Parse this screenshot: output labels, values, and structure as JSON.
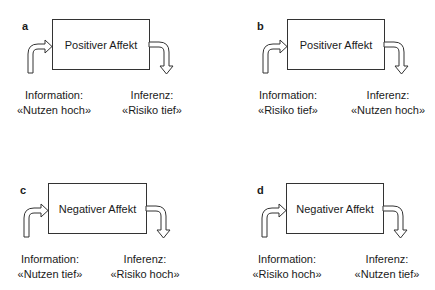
{
  "panels": [
    {
      "letter": "a",
      "affect": "Positiver Affekt",
      "info_label": "Information:",
      "info_value": "«Nutzen hoch»",
      "inf_label": "Inferenz:",
      "inf_value": "«Risiko tief»"
    },
    {
      "letter": "b",
      "affect": "Positiver Affekt",
      "info_label": "Information:",
      "info_value": "«Risiko tief»",
      "inf_label": "Inferenz:",
      "inf_value": "«Nutzen hoch»"
    },
    {
      "letter": "c",
      "affect": "Negativer Affekt",
      "info_label": "Information:",
      "info_value": "«Nutzen tief»",
      "inf_label": "Inferenz:",
      "inf_value": "«Risiko hoch»"
    },
    {
      "letter": "d",
      "affect": "Negativer Affekt",
      "info_label": "Information:",
      "info_value": "«Risiko hoch»",
      "inf_label": "Inferenz:",
      "inf_value": "«Nutzen tief»"
    }
  ]
}
